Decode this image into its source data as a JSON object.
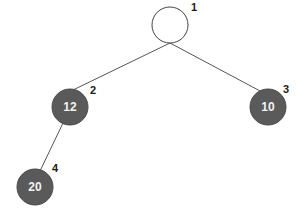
{
  "diagram": {
    "type": "binary-tree",
    "colors": {
      "empty_node_fill": "#ffffff",
      "filled_node_fill": "#5a5a5a",
      "edge": "#555555",
      "value_text": "#f2f2f2",
      "index_text": "#1a1a1a"
    },
    "nodes": [
      {
        "index": "1",
        "value": "",
        "filled": false
      },
      {
        "index": "2",
        "value": "12",
        "filled": true
      },
      {
        "index": "3",
        "value": "10",
        "filled": true
      },
      {
        "index": "4",
        "value": "20",
        "filled": true
      }
    ],
    "edges": [
      {
        "from": "1",
        "to": "2"
      },
      {
        "from": "1",
        "to": "3"
      },
      {
        "from": "2",
        "to": "4"
      }
    ]
  }
}
